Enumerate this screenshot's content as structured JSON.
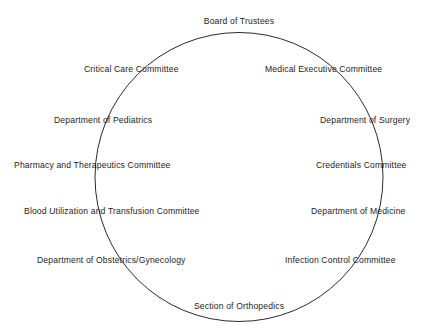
{
  "diagram": {
    "type": "circle-organizational-diagram",
    "background_color": "#ffffff",
    "stroke_color": "#2b2b2b",
    "text_color": "#1d1d1d",
    "circle": {
      "center_x": 239,
      "center_y": 177,
      "radius_x": 144,
      "radius_y": 144.5,
      "stroke_width": 1
    },
    "nodes": [
      {
        "id": "board-of-trustees",
        "label": "Board of Trustees",
        "x": 239,
        "y": 16,
        "anchor": "center"
      },
      {
        "id": "critical-care-committee",
        "label": "Critical Care Committee",
        "x": 84,
        "y": 64,
        "anchor": "left"
      },
      {
        "id": "medical-executive-committee",
        "label": "Medical Executive Committee",
        "x": 265,
        "y": 64,
        "anchor": "left"
      },
      {
        "id": "department-of-pediatrics",
        "label": "Department of Pediatrics",
        "x": 54,
        "y": 115,
        "anchor": "left"
      },
      {
        "id": "department-of-surgery",
        "label": "Department of Surgery",
        "x": 320,
        "y": 115,
        "anchor": "left"
      },
      {
        "id": "pharmacy-and-therapeutics-committee",
        "label": "Pharmacy and Therapeutics Committee",
        "x": 14,
        "y": 160,
        "anchor": "left"
      },
      {
        "id": "credentials-committee",
        "label": "Credentials Committee",
        "x": 316,
        "y": 160,
        "anchor": "left"
      },
      {
        "id": "blood-utilization-and-transfusion-committee",
        "label": "Blood Utilization and Transfusion Committee",
        "x": 24,
        "y": 206,
        "anchor": "left"
      },
      {
        "id": "department-of-medicine",
        "label": "Department of Medicine",
        "x": 311,
        "y": 206,
        "anchor": "left"
      },
      {
        "id": "department-of-obstetrics-gynecology",
        "label": "Department of Obstetrics/Gynecology",
        "x": 37,
        "y": 255,
        "anchor": "left"
      },
      {
        "id": "infection-control-committee",
        "label": "Infection Control Committee",
        "x": 285,
        "y": 255,
        "anchor": "left"
      },
      {
        "id": "section-of-orthopedics",
        "label": "Section of Orthopedics",
        "x": 239,
        "y": 301,
        "anchor": "center"
      }
    ]
  }
}
